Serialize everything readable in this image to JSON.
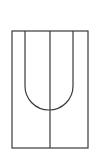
{
  "diagram": {
    "stroke_color": "#3a3a3a",
    "background_color": "#ffffff",
    "elements": [
      {
        "name": "outer-rectangle",
        "type": "rectangle"
      },
      {
        "name": "center-divider",
        "type": "vertical-line"
      },
      {
        "name": "u-shape",
        "type": "u-curve"
      }
    ]
  }
}
